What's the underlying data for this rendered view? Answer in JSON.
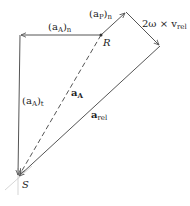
{
  "diagram": {
    "points": {
      "S": {
        "label": "S",
        "x": 18,
        "y": 177
      },
      "R": {
        "label": "R",
        "x": 101,
        "y": 35
      },
      "corner": {
        "x": 20,
        "y": 35
      },
      "apex": {
        "x": 126,
        "y": 12
      },
      "right": {
        "x": 160,
        "y": 46
      }
    },
    "vectors": [
      {
        "id": "aA_n",
        "label_main": "(a",
        "label_sub": "A",
        "label_close": ")",
        "label_sub2": "n",
        "from": "R",
        "to": "corner"
      },
      {
        "id": "aA_t",
        "label_main": "(a",
        "label_sub": "A",
        "label_close": ")",
        "label_sub2": "t",
        "from": "corner",
        "to": "S"
      },
      {
        "id": "aP_n",
        "label_main": "(a",
        "label_sub": "P",
        "label_close": ")",
        "label_sub2": "n",
        "from": "R",
        "to": "apex"
      },
      {
        "id": "coriolis",
        "label_main": "2ω × v",
        "label_sub": "rel",
        "from": "apex",
        "to": "right"
      },
      {
        "id": "a_rel",
        "label_main": "a",
        "label_sub": "rel",
        "from": "right",
        "to": "S"
      },
      {
        "id": "a_A",
        "label_main": "a",
        "label_sub": "A",
        "from": "R",
        "to": "S",
        "style": "dashed"
      }
    ],
    "colors": {
      "line": "#555555",
      "text": "#222222"
    }
  }
}
